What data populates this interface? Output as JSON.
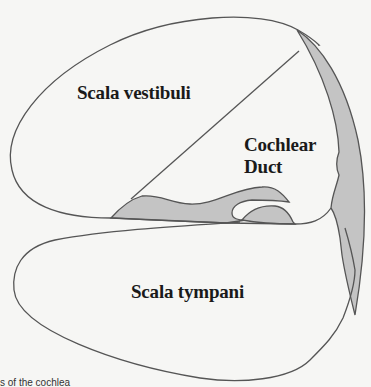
{
  "figure": {
    "labels": {
      "scala_vestibuli": "Scala vestibuli",
      "cochlear_duct_line1": "Cochlear",
      "cochlear_duct_line2": "Duct",
      "scala_tympani": "Scala tympani"
    },
    "caption_fragment": "s of the cochlea"
  },
  "colors": {
    "background": "#f6f6f4",
    "outline": "#555555",
    "tissue_fill": "#c4c4c4",
    "chamber_fill": "#f6f6f4",
    "text": "#1a1a1a"
  }
}
